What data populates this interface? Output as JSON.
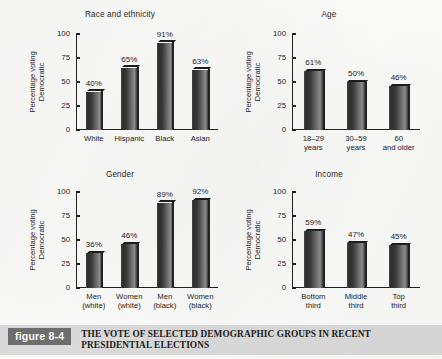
{
  "figure": {
    "number_label": "figure 8-4",
    "caption": "THE VOTE OF SELECTED DEMOGRAPHIC GROUPS IN RECENT PRESIDENTIAL ELECTIONS",
    "axis_label_line1": "Percentage voting",
    "axis_label_line2": "Democratic",
    "accent_color": "#6f6f6f",
    "caption_bar_color": "#dcdcdc",
    "bar_color": "#3a3a3a"
  },
  "chart_data": [
    {
      "type": "bar",
      "title": "Race and ethnicity",
      "xlabel": "",
      "ylabel": "Percentage voting Democratic",
      "ylim": [
        0,
        100
      ],
      "yticks": [
        0,
        25,
        50,
        75,
        100
      ],
      "ytick_labels": [
        "0",
        "25",
        "50",
        "75",
        "100"
      ],
      "grid": false,
      "legend": "none",
      "categories": [
        "White",
        "Hispanic",
        "Black",
        "Asian"
      ],
      "category_lines": [
        [
          "White"
        ],
        [
          "Hispanic"
        ],
        [
          "Black"
        ],
        [
          "Asian"
        ]
      ],
      "values": [
        40,
        65,
        91,
        63
      ],
      "data_labels": [
        "40%",
        "65%",
        "91%",
        "63%"
      ]
    },
    {
      "type": "bar",
      "title": "Age",
      "xlabel": "",
      "ylabel": "Percentage voting Democratic",
      "ylim": [
        0,
        100
      ],
      "yticks": [
        0,
        25,
        50,
        75,
        100
      ],
      "ytick_labels": [
        "0",
        "25",
        "50",
        "75",
        "100"
      ],
      "grid": false,
      "legend": "none",
      "categories": [
        "18–29 years",
        "30–59 years",
        "60 and older"
      ],
      "category_lines": [
        [
          "18–29",
          "years"
        ],
        [
          "30–59",
          "years"
        ],
        [
          "60",
          "and older"
        ]
      ],
      "values": [
        61,
        50,
        46
      ],
      "data_labels": [
        "61%",
        "50%",
        "46%"
      ]
    },
    {
      "type": "bar",
      "title": "Gender",
      "xlabel": "",
      "ylabel": "Percentage voting Democratic",
      "ylim": [
        0,
        100
      ],
      "yticks": [
        0,
        25,
        50,
        75,
        100
      ],
      "ytick_labels": [
        "0",
        "25",
        "50",
        "75",
        "100"
      ],
      "grid": false,
      "legend": "none",
      "categories": [
        "Men (white)",
        "Women (white)",
        "Men (black)",
        "Women (black)"
      ],
      "category_lines": [
        [
          "Men",
          "(white)"
        ],
        [
          "Women",
          "(white)"
        ],
        [
          "Men",
          "(black)"
        ],
        [
          "Women",
          "(black)"
        ]
      ],
      "values": [
        36,
        46,
        89,
        92
      ],
      "data_labels": [
        "36%",
        "46%",
        "89%",
        "92%"
      ]
    },
    {
      "type": "bar",
      "title": "Income",
      "xlabel": "",
      "ylabel": "Percentage voting Democratic",
      "ylim": [
        0,
        100
      ],
      "yticks": [
        0,
        25,
        50,
        75,
        100
      ],
      "ytick_labels": [
        "0",
        "25",
        "50",
        "75",
        "100"
      ],
      "grid": false,
      "legend": "none",
      "categories": [
        "Bottom third",
        "Middle third",
        "Top third"
      ],
      "category_lines": [
        [
          "Bottom",
          "third"
        ],
        [
          "Middle",
          "third"
        ],
        [
          "Top",
          "third"
        ]
      ],
      "values": [
        59,
        47,
        45
      ],
      "data_labels": [
        "59%",
        "47%",
        "45%"
      ]
    }
  ]
}
